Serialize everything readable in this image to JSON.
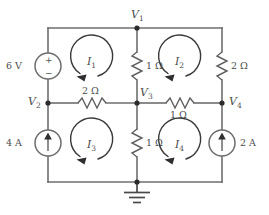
{
  "figure": {
    "name": "resistive-circuit-with-mesh-currents",
    "type": "electrical-circuit-schematic",
    "width": 269,
    "height": 215,
    "background_color": "#ffffff",
    "wire_color": "#6e6e6e",
    "text_color": "#4d4d4d"
  },
  "nodes": [
    {
      "id": "V1",
      "label": "V",
      "sub": "1",
      "x": 137,
      "y": 28
    },
    {
      "id": "V2",
      "label": "V",
      "sub": "2",
      "x": 48,
      "y": 103
    },
    {
      "id": "V3",
      "label": "V",
      "sub": "3",
      "x": 137,
      "y": 103
    },
    {
      "id": "V4",
      "label": "V",
      "sub": "4",
      "x": 222,
      "y": 103
    },
    {
      "id": "GND",
      "label": "",
      "sub": "",
      "x": 137,
      "y": 182
    }
  ],
  "sources": [
    {
      "id": "source-6v",
      "kind": "voltage-source",
      "value": "6 V",
      "plus_symbol": "+",
      "minus_symbol": "−",
      "polarity": "plus-top",
      "x": 48,
      "y": 66
    },
    {
      "id": "source-4a",
      "kind": "current-source",
      "value": "4 A",
      "direction": "up",
      "x": 48,
      "y": 143
    },
    {
      "id": "source-2a",
      "kind": "current-source",
      "value": "2 A",
      "direction": "up",
      "x": 222,
      "y": 143
    }
  ],
  "resistors": [
    {
      "id": "r-center-top",
      "value": "1 Ω",
      "orientation": "vertical",
      "x": 137,
      "y": 66,
      "label_side": "right"
    },
    {
      "id": "r-right-top",
      "value": "2 Ω",
      "orientation": "vertical",
      "x": 222,
      "y": 66,
      "label_side": "right"
    },
    {
      "id": "r-mid-left",
      "value": "2 Ω",
      "orientation": "horizontal",
      "x": 92,
      "y": 103,
      "label_side": "above"
    },
    {
      "id": "r-mid-right",
      "value": "1 Ω",
      "orientation": "horizontal",
      "x": 180,
      "y": 103,
      "label_side": "below"
    },
    {
      "id": "r-center-bottom",
      "value": "1 Ω",
      "orientation": "vertical",
      "x": 137,
      "y": 143,
      "label_side": "right"
    }
  ],
  "mesh_currents": [
    {
      "id": "mesh-I1",
      "label": "I",
      "sub": "1",
      "direction": "counterclockwise",
      "cx": 92,
      "cy": 62
    },
    {
      "id": "mesh-I2",
      "label": "I",
      "sub": "2",
      "direction": "counterclockwise",
      "cx": 180,
      "cy": 62
    },
    {
      "id": "mesh-I3",
      "label": "I",
      "sub": "3",
      "direction": "counterclockwise",
      "cx": 92,
      "cy": 145
    },
    {
      "id": "mesh-I4",
      "label": "I",
      "sub": "4",
      "direction": "counterclockwise",
      "cx": 180,
      "cy": 145
    }
  ],
  "ground": {
    "id": "ground-symbol",
    "x": 137,
    "y": 182
  },
  "labels": {
    "v1": "V",
    "v1_sub": "1",
    "v2": "V",
    "v2_sub": "2",
    "v3": "V",
    "v3_sub": "3",
    "v4": "V",
    "v4_sub": "4",
    "i1": "I",
    "i1_sub": "1",
    "i2": "I",
    "i2_sub": "2",
    "i3": "I",
    "i3_sub": "3",
    "i4": "I",
    "i4_sub": "4",
    "src_6v": "6 V",
    "src_4a": "4 A",
    "src_2a": "2 A",
    "r_1ohm_center_top": "1 Ω",
    "r_2ohm_right": "2 Ω",
    "r_2ohm_mid": "2 Ω",
    "r_1ohm_mid": "1 Ω",
    "r_1ohm_center_bottom": "1 Ω",
    "plus": "+",
    "minus": "−"
  }
}
